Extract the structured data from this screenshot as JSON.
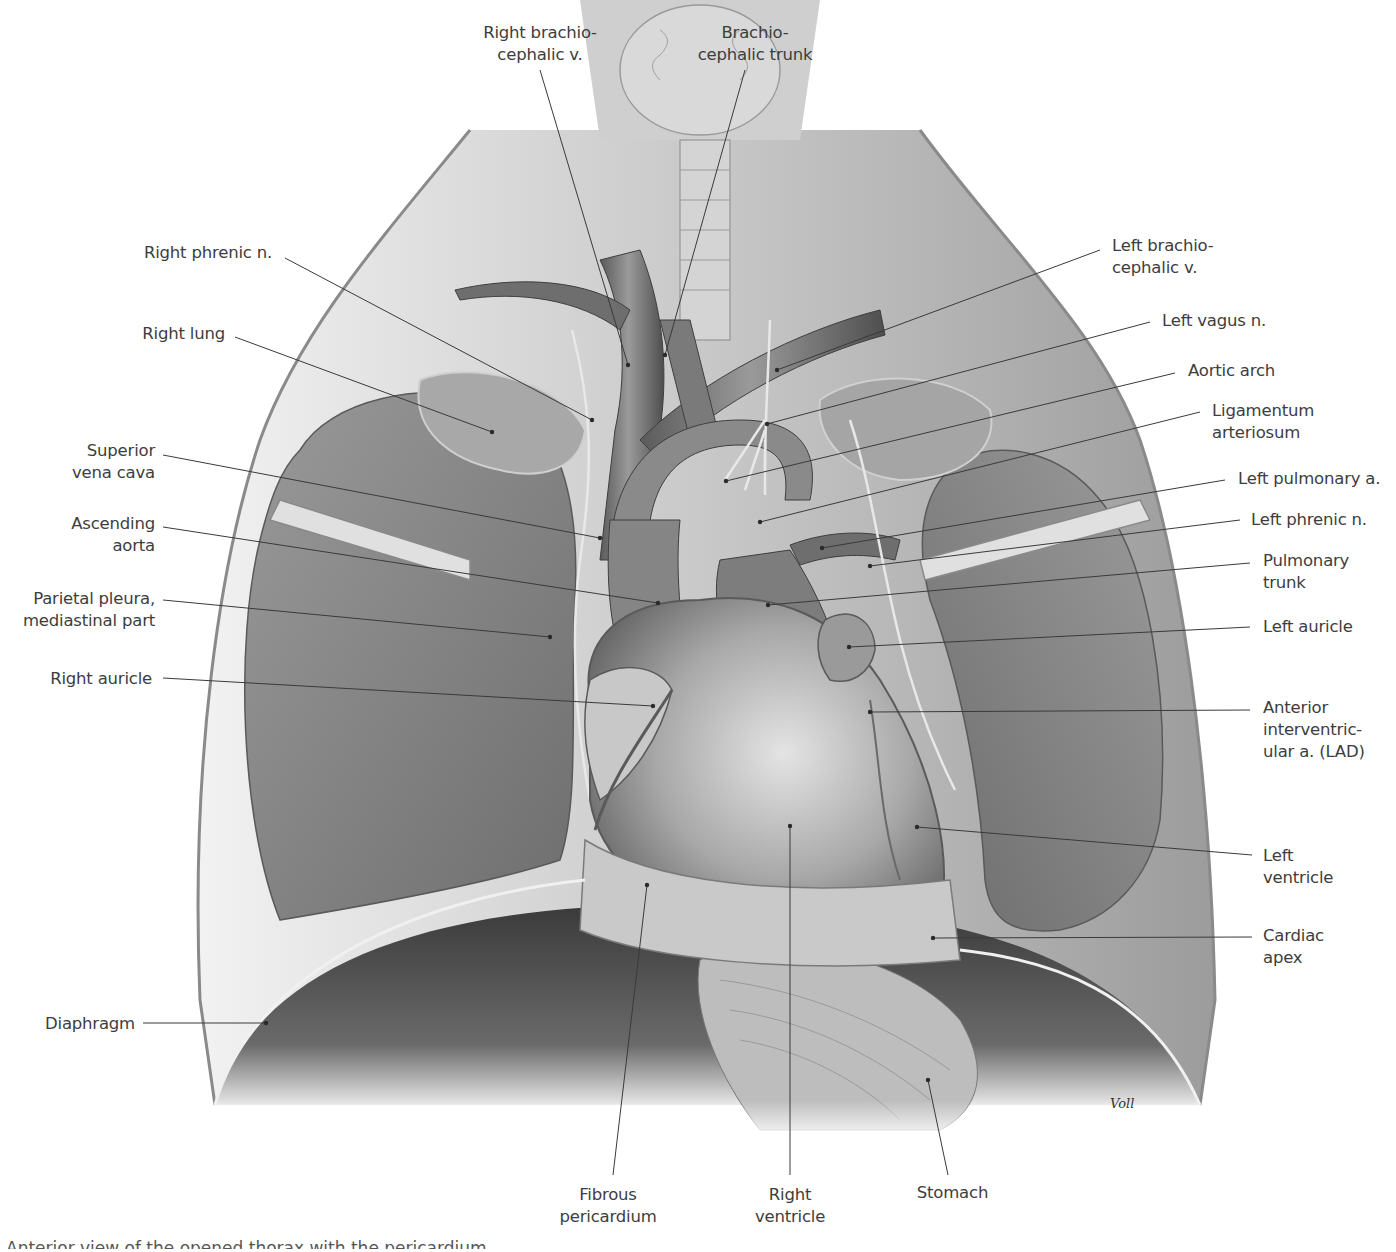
{
  "figure": {
    "artist_signature": "Voll",
    "caption_partial": "Anterior view of the opened thorax with the pericardium",
    "colors": {
      "background": "#ffffff",
      "label_text": "#3d3d3d",
      "leader_line": "#3a3a3a",
      "tissue_dark": "#4a4a4a",
      "tissue_mid": "#8a8a8a",
      "tissue_light": "#d6d6d6"
    }
  },
  "labels": {
    "top": [
      {
        "id": "right-brachiocephalic-v",
        "text": "Right brachio-\ncephalic v.",
        "x": 470,
        "y": 22,
        "align": "c",
        "w": 140,
        "line": [
          540,
          70,
          628,
          365
        ]
      },
      {
        "id": "brachiocephalic-trunk",
        "text": "Brachio-\ncephalic trunk",
        "x": 690,
        "y": 22,
        "align": "c",
        "w": 130,
        "line": [
          745,
          70,
          665,
          355
        ]
      }
    ],
    "left": [
      {
        "id": "right-phrenic-n",
        "text": "Right phrenic n.",
        "x": 100,
        "y": 242,
        "align": "r",
        "w": 170,
        "line": [
          285,
          258,
          592,
          420
        ]
      },
      {
        "id": "right-lung",
        "text": "Right lung",
        "x": 100,
        "y": 323,
        "align": "r",
        "w": 125,
        "line": [
          235,
          337,
          492,
          432
        ]
      },
      {
        "id": "superior-vena-cava",
        "text": "Superior\nvena cava",
        "x": 60,
        "y": 440,
        "align": "r",
        "w": 95,
        "line": [
          163,
          455,
          600,
          538
        ]
      },
      {
        "id": "ascending-aorta",
        "text": "Ascending\naorta",
        "x": 50,
        "y": 513,
        "align": "r",
        "w": 105,
        "line": [
          163,
          527,
          658,
          603
        ]
      },
      {
        "id": "parietal-pleura",
        "text": "Parietal pleura,\nmediastinal part",
        "x": 20,
        "y": 588,
        "align": "r",
        "w": 135,
        "line": [
          163,
          600,
          550,
          637
        ]
      },
      {
        "id": "right-auricle",
        "text": "Right auricle",
        "x": 30,
        "y": 668,
        "align": "r",
        "w": 122,
        "line": [
          163,
          678,
          653,
          706
        ]
      },
      {
        "id": "diaphragm",
        "text": "Diaphragm",
        "x": 20,
        "y": 1013,
        "align": "r",
        "w": 115,
        "line": [
          143,
          1023,
          266,
          1023
        ]
      }
    ],
    "right": [
      {
        "id": "left-brachiocephalic-v",
        "text": "Left brachio-\ncephalic v.",
        "x": 1112,
        "y": 235,
        "align": "l",
        "w": 140,
        "line": [
          1100,
          250,
          777,
          370
        ]
      },
      {
        "id": "left-vagus-n",
        "text": "Left vagus n.",
        "x": 1162,
        "y": 310,
        "align": "l",
        "w": 140,
        "line": [
          1150,
          322,
          767,
          424
        ]
      },
      {
        "id": "aortic-arch",
        "text": "Aortic arch",
        "x": 1188,
        "y": 360,
        "align": "l",
        "w": 140,
        "line": [
          1175,
          373,
          726,
          481
        ]
      },
      {
        "id": "ligamentum-arteriosum",
        "text": "Ligamentum\narteriosum",
        "x": 1212,
        "y": 400,
        "align": "l",
        "w": 140,
        "line": [
          1200,
          412,
          760,
          522
        ]
      },
      {
        "id": "left-pulmonary-a",
        "text": "Left pulmonary a.",
        "x": 1238,
        "y": 468,
        "align": "l",
        "w": 160,
        "line": [
          1225,
          480,
          822,
          548
        ]
      },
      {
        "id": "left-phrenic-n",
        "text": "Left phrenic n.",
        "x": 1251,
        "y": 509,
        "align": "l",
        "w": 140,
        "line": [
          1240,
          520,
          870,
          566
        ]
      },
      {
        "id": "pulmonary-trunk",
        "text": "Pulmonary\ntrunk",
        "x": 1263,
        "y": 550,
        "align": "l",
        "w": 110,
        "line": [
          1250,
          563,
          768,
          605
        ]
      },
      {
        "id": "left-auricle",
        "text": "Left auricle",
        "x": 1263,
        "y": 616,
        "align": "l",
        "w": 110,
        "line": [
          1250,
          627,
          849,
          647
        ]
      },
      {
        "id": "anterior-interventricular-a",
        "text": "Anterior\ninterventric-\nular a. (LAD)",
        "x": 1263,
        "y": 697,
        "align": "l",
        "w": 120,
        "line": [
          1250,
          710,
          870,
          712
        ]
      },
      {
        "id": "left-ventricle",
        "text": "Left\nventricle",
        "x": 1263,
        "y": 845,
        "align": "l",
        "w": 100,
        "line": [
          1252,
          855,
          917,
          827
        ]
      },
      {
        "id": "cardiac-apex",
        "text": "Cardiac\napex",
        "x": 1263,
        "y": 925,
        "align": "l",
        "w": 100,
        "line": [
          1252,
          937,
          933,
          938
        ]
      }
    ],
    "bottom": [
      {
        "id": "fibrous-pericardium",
        "text": "Fibrous\npericardium",
        "x": 552,
        "y": 1184,
        "align": "c",
        "w": 110,
        "line": [
          613,
          1175,
          647,
          885
        ]
      },
      {
        "id": "right-ventricle",
        "text": "Right\nventricle",
        "x": 745,
        "y": 1184,
        "align": "c",
        "w": 90,
        "line": [
          790,
          1175,
          790,
          826
        ]
      },
      {
        "id": "stomach",
        "text": "Stomach",
        "x": 905,
        "y": 1182,
        "align": "c",
        "w": 95,
        "line": [
          948,
          1175,
          928,
          1080
        ]
      }
    ]
  }
}
